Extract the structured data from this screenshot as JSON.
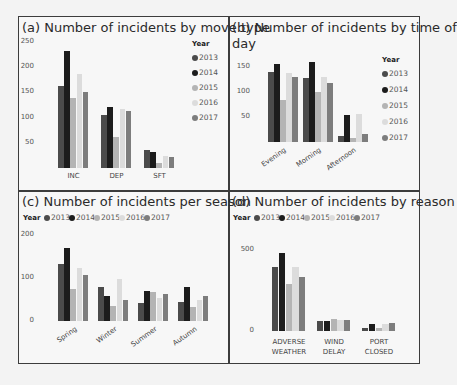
{
  "colors": {
    "2013": "#4b4b4b",
    "2014": "#1c1c1c",
    "2015": "#b4b4b4",
    "2016": "#dcdcdc",
    "2017": "#7d7d7d"
  },
  "legend": {
    "title": "Year",
    "years": [
      "2013",
      "2014",
      "2015",
      "2016",
      "2017"
    ]
  },
  "panels": {
    "a": {
      "title": "(a) Number of incidents by move type"
    },
    "b": {
      "title_line1": "(b) Number of incidents by time of",
      "title_line2": "day"
    },
    "c": {
      "title": "(c) Number of incidents per season"
    },
    "d": {
      "title": "(d) Number of incidents by reason"
    }
  },
  "chart_data": [
    {
      "type": "bar",
      "title": "(a) Number of incidents by move type",
      "categories": [
        "INC",
        "DEP",
        "SFT"
      ],
      "yticks": [
        50,
        100,
        150,
        200,
        250
      ],
      "ylim": [
        0,
        250
      ],
      "legend_position": "right",
      "series": [
        {
          "name": "2013",
          "values": [
            163,
            105,
            36
          ]
        },
        {
          "name": "2014",
          "values": [
            232,
            121,
            31
          ]
        },
        {
          "name": "2015",
          "values": [
            138,
            62,
            9
          ]
        },
        {
          "name": "2016",
          "values": [
            187,
            117,
            23
          ]
        },
        {
          "name": "2017",
          "values": [
            150,
            112,
            22
          ]
        }
      ]
    },
    {
      "type": "bar",
      "title": "(b) Number of incidents by time of day",
      "categories": [
        "Evening",
        "Morning",
        "Afternoon"
      ],
      "yticks": [
        50,
        100,
        150
      ],
      "ylim": [
        0,
        165
      ],
      "legend_position": "right",
      "series": [
        {
          "name": "2013",
          "values": [
            140,
            129,
            12
          ]
        },
        {
          "name": "2014",
          "values": [
            157,
            160,
            55
          ]
        },
        {
          "name": "2015",
          "values": [
            85,
            100,
            8
          ]
        },
        {
          "name": "2016",
          "values": [
            138,
            131,
            57
          ]
        },
        {
          "name": "2017",
          "values": [
            130,
            118,
            16
          ]
        }
      ]
    },
    {
      "type": "bar",
      "title": "(c) Number of incidents per season",
      "categories": [
        "Spring",
        "Winter",
        "Summer",
        "Autumn"
      ],
      "yticks": [
        0,
        100,
        200
      ],
      "ylim": [
        0,
        200
      ],
      "legend_position": "top",
      "series": [
        {
          "name": "2013",
          "values": [
            133,
            78,
            42,
            45
          ]
        },
        {
          "name": "2014",
          "values": [
            170,
            59,
            70,
            78
          ]
        },
        {
          "name": "2015",
          "values": [
            75,
            35,
            68,
            32
          ]
        },
        {
          "name": "2016",
          "values": [
            123,
            97,
            53,
            50
          ]
        },
        {
          "name": "2017",
          "values": [
            108,
            50,
            63,
            58
          ]
        }
      ]
    },
    {
      "type": "bar",
      "title": "(d) Number of incidents by reason",
      "categories": [
        "ADVERSE WEATHER",
        "WIND DELAY",
        "PORT CLOSED"
      ],
      "yticks": [
        0,
        500
      ],
      "ylim": [
        0,
        500
      ],
      "legend_position": "top",
      "series": [
        {
          "name": "2013",
          "values": [
            390,
            60,
            20
          ]
        },
        {
          "name": "2014",
          "values": [
            480,
            62,
            45
          ]
        },
        {
          "name": "2015",
          "values": [
            290,
            75,
            20
          ]
        },
        {
          "name": "2016",
          "values": [
            390,
            65,
            40
          ]
        },
        {
          "name": "2017",
          "values": [
            330,
            70,
            48
          ]
        }
      ]
    }
  ]
}
